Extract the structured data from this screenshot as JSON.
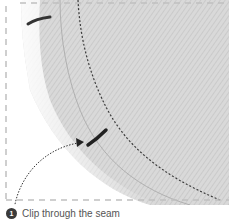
{
  "illustration": {
    "subject": "curved-seam-fabric",
    "colors": {
      "fabric": "#d6d6d6",
      "fabric_dark": "#9a9a9a",
      "stitch": "#3c3c3c",
      "frame": "#bdbdbd"
    }
  },
  "caption": {
    "step": "1",
    "text": "Clip through the seam"
  }
}
